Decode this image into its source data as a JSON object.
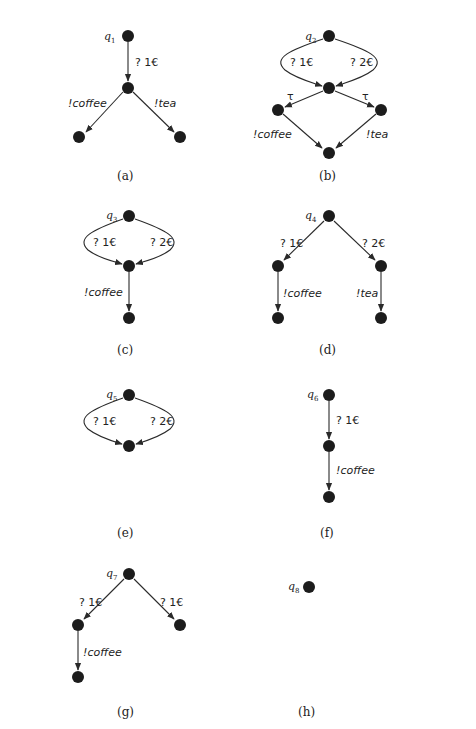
{
  "figure": {
    "diagrams": [
      {
        "id": "a",
        "caption": "(a)",
        "state_name": "q",
        "state_index": "1",
        "transitions": [
          {
            "from": "q1",
            "to": "s1",
            "label": "? 1€"
          },
          {
            "from": "s1",
            "to": "s2",
            "label": "!coffee"
          },
          {
            "from": "s1",
            "to": "s3",
            "label": "!tea"
          }
        ]
      },
      {
        "id": "b",
        "caption": "(b)",
        "state_name": "q",
        "state_index": "2",
        "transitions": [
          {
            "from": "q2",
            "to": "s1",
            "label": "? 1€"
          },
          {
            "from": "q2",
            "to": "s1",
            "label": "? 2€"
          },
          {
            "from": "s1",
            "to": "s2",
            "label": "τ"
          },
          {
            "from": "s1",
            "to": "s3",
            "label": "τ"
          },
          {
            "from": "s2",
            "to": "s4",
            "label": "!coffee"
          },
          {
            "from": "s3",
            "to": "s4",
            "label": "!tea"
          }
        ]
      },
      {
        "id": "c",
        "caption": "(c)",
        "state_name": "q",
        "state_index": "3",
        "transitions": [
          {
            "from": "q3",
            "to": "s1",
            "label": "? 1€"
          },
          {
            "from": "q3",
            "to": "s1",
            "label": "? 2€"
          },
          {
            "from": "s1",
            "to": "s2",
            "label": "!coffee"
          }
        ]
      },
      {
        "id": "d",
        "caption": "(d)",
        "state_name": "q",
        "state_index": "4",
        "transitions": [
          {
            "from": "q4",
            "to": "s1",
            "label": "? 1€"
          },
          {
            "from": "q4",
            "to": "s2",
            "label": "? 2€"
          },
          {
            "from": "s1",
            "to": "s3",
            "label": "!coffee"
          },
          {
            "from": "s2",
            "to": "s4",
            "label": "!tea"
          }
        ]
      },
      {
        "id": "e",
        "caption": "(e)",
        "state_name": "q",
        "state_index": "5",
        "transitions": [
          {
            "from": "q5",
            "to": "s1",
            "label": "? 1€"
          },
          {
            "from": "q5",
            "to": "s1",
            "label": "? 2€"
          }
        ]
      },
      {
        "id": "f",
        "caption": "(f)",
        "state_name": "q",
        "state_index": "6",
        "transitions": [
          {
            "from": "q6",
            "to": "s1",
            "label": "? 1€"
          },
          {
            "from": "s1",
            "to": "s2",
            "label": "!coffee"
          }
        ]
      },
      {
        "id": "g",
        "caption": "(g)",
        "state_name": "q",
        "state_index": "7",
        "transitions": [
          {
            "from": "q7",
            "to": "s1",
            "label": "? 1€"
          },
          {
            "from": "q7",
            "to": "s2",
            "label": "? 1€"
          },
          {
            "from": "s1",
            "to": "s3",
            "label": "!coffee"
          }
        ]
      },
      {
        "id": "h",
        "caption": "(h)",
        "state_name": "q",
        "state_index": "8",
        "transitions": []
      }
    ]
  }
}
